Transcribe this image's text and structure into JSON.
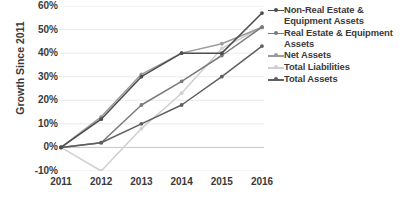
{
  "chart_data": {
    "type": "line",
    "title": "",
    "xlabel": "",
    "ylabel": "Growth Since 2011",
    "categories": [
      "2011",
      "2012",
      "2013",
      "2014",
      "2015",
      "2016"
    ],
    "x": [
      2011,
      2012,
      2013,
      2014,
      2015,
      2016
    ],
    "ylim": [
      -10,
      60
    ],
    "ytick_labels": [
      "60%",
      "50%",
      "40%",
      "30%",
      "20%",
      "10%",
      "0%",
      "-10%"
    ],
    "ytick_values": [
      60,
      50,
      40,
      30,
      20,
      10,
      0,
      -10
    ],
    "grid": true,
    "grid_axis": "y",
    "legend_position": "right",
    "value_suffix": "%",
    "series": [
      {
        "name": "Non-Real Estate & Equipment Assets",
        "color": "#4d4d4d",
        "values": [
          0,
          12,
          30,
          40,
          40,
          57
        ]
      },
      {
        "name": "Real Estate & Equipment Assets",
        "color": "#7a7a7a",
        "values": [
          0,
          2,
          18,
          28,
          39,
          51
        ]
      },
      {
        "name": "Net Assets",
        "color": "#9a9a9a",
        "values": [
          0,
          13,
          31,
          40,
          44,
          51
        ]
      },
      {
        "name": "Total Liabilities",
        "color": "#cfcfcf",
        "values": [
          0,
          -10,
          8,
          23,
          42,
          51
        ]
      },
      {
        "name": "Total Assets",
        "color": "#5f5f5f",
        "values": [
          0,
          2,
          10,
          18,
          30,
          43
        ]
      }
    ]
  },
  "legend": {
    "entries": [
      {
        "label": "Non-Real Estate & Equipment Assets",
        "color": "#4d4d4d"
      },
      {
        "label": "Real Estate & Equipment Assets",
        "color": "#7a7a7a"
      },
      {
        "label": "Net Assets",
        "color": "#9a9a9a"
      },
      {
        "label": "Total Liabilities",
        "color": "#cfcfcf"
      },
      {
        "label": "Total Assets",
        "color": "#5f5f5f"
      }
    ]
  },
  "axes": {
    "y_title": "Growth Since 2011"
  },
  "colors": {
    "text": "#3a3a3a",
    "grid": "#e4e4e4",
    "axis": "#bfbfbf",
    "background": "#ffffff"
  }
}
